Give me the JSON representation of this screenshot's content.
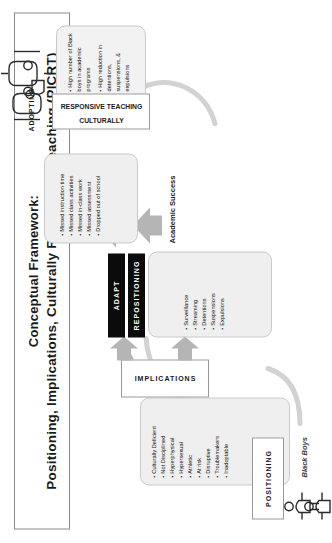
{
  "title": {
    "line1": "Conceptual Framework:",
    "line2": "Positioning, Implications, Culturally Responsive Teaching (PICRT)"
  },
  "stages": {
    "positioning": "POSITIONING",
    "implications": "IMPLICATIONS",
    "adapt": "ADAPT",
    "repositioning": "REPOSITIONING",
    "adopting": "ADOPTING",
    "crt_line1": "CULTURALLY",
    "crt_line2": "RESPONSIVE TEACHING",
    "academic_success": "Academic Success",
    "black_boys": "Black Boys"
  },
  "positioning_traits": [
    "Culturally Deficient",
    "Not Disciplined",
    "Hyperphysical",
    "Hypersexual",
    "Athletic",
    "At risk",
    "Disruptive",
    "Troublemakers",
    "Inadoptable"
  ],
  "implication_practices": [
    "Surveillance",
    "Streaming",
    "Detentions",
    "Suspensions",
    "Expulsions"
  ],
  "implication_outcomes": [
    "Missed instruction time",
    "Missed class activities",
    "Missed in-class work",
    "Missed assessment",
    "Dropped out of school"
  ],
  "crt_outcomes": [
    "High number of Black boys in academic programs",
    "High reduction in detentions, suspensions, & expulsions"
  ],
  "colors": {
    "panel_fill": "#efefef",
    "panel_border": "#c9c9c9",
    "bar_fill": "#0b0b0b",
    "arrow_fill": "#b5b5b5",
    "frame_border": "#8a8a8a",
    "text": "#1a1a1a"
  },
  "icons": {
    "person_left": "person-icon",
    "person_right": "person-icon",
    "teacher_left": "person-icon",
    "teacher_right": "person-icon"
  }
}
